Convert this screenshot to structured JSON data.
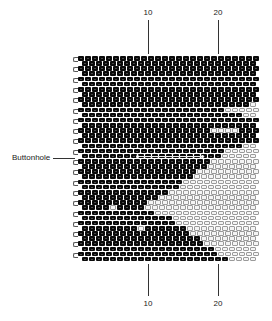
{
  "figure": {
    "top_ticks": [
      {
        "label": "10",
        "x": 148
      },
      {
        "label": "20",
        "x": 218
      }
    ],
    "bottom_ticks": [
      {
        "label": "10",
        "x": 148
      },
      {
        "label": "20",
        "x": 218
      }
    ],
    "callout": {
      "label": "Buttonhole",
      "row": 19
    },
    "colors": {
      "bead_dark": "#0a0a0a",
      "bead_light": "#f4f4f4",
      "outline": "#9a9a9a"
    },
    "grid": {
      "columns": 26,
      "rows": 40,
      "left": 78,
      "top": 56,
      "bead_w": 7,
      "bead_h": 5.15,
      "white_spans": {
        "9": [
          [
            24,
            25
          ]
        ],
        "10": [
          [
            21,
            25
          ]
        ],
        "11": [
          [
            23,
            25
          ]
        ],
        "14": [
          [
            19,
            22
          ]
        ],
        "17": [
          [
            23,
            25
          ]
        ],
        "18": [
          [
            21,
            25
          ]
        ],
        "19": [
          [
            20,
            25
          ]
        ],
        "20": [
          [
            19,
            25
          ]
        ],
        "21": [
          [
            18,
            25
          ]
        ],
        "22": [
          [
            17,
            25
          ]
        ],
        "23": [
          [
            16,
            25
          ]
        ],
        "24": [
          [
            15,
            25
          ]
        ],
        "25": [
          [
            14,
            25
          ]
        ],
        "26": [
          [
            13,
            25
          ]
        ],
        "27": [
          [
            11,
            25
          ]
        ],
        "28": [
          [
            10,
            25
          ]
        ],
        "29": [
          [
            9,
            25
          ]
        ],
        "30": [
          [
            11,
            25
          ]
        ],
        "31": [
          [
            13,
            25
          ]
        ],
        "32": [
          [
            14,
            25
          ]
        ],
        "33": [
          [
            15,
            25
          ]
        ],
        "34": [
          [
            16,
            25
          ]
        ],
        "35": [
          [
            17,
            25
          ]
        ],
        "36": [
          [
            18,
            25
          ]
        ],
        "37": [
          [
            19,
            25
          ]
        ],
        "38": [
          [
            20,
            25
          ]
        ],
        "39": [
          [
            21,
            25
          ]
        ]
      },
      "stray_white": [
        [
          33,
          8
        ],
        [
          29,
          4
        ]
      ]
    }
  }
}
